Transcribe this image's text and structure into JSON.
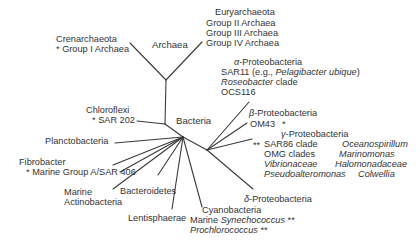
{
  "diagram": {
    "type": "unrooted phylogenetic tree",
    "line_color": "#3a3a3a",
    "text_color": "#333333"
  },
  "domains": {
    "archaea": "Archaea",
    "bacteria": "Bacteria"
  },
  "archaea": {
    "crenarchaeota": {
      "name": "Crenarchaeota",
      "sub": "* Group I Archaea"
    },
    "euryarchaeota": {
      "name": "Euryarchaeota",
      "groups": [
        "Group II Archaea",
        "Group III Archaea",
        "Group IV Archaea"
      ]
    }
  },
  "bacteria": {
    "chloroflexi": {
      "name": "Chloroflexi",
      "sub": "* SAR 202"
    },
    "planctobacteria": "Planctobacteria",
    "fibrobacter": {
      "name": "Fibrobacter",
      "sub": "* Marine Group A/SAR 406"
    },
    "actinobacteria": {
      "line1": "Marine",
      "line2": "Actinobacteria"
    },
    "bacteroidetes": "Bacteroidetes",
    "lentisphaerae": "Lentisphaerae",
    "cyanobacteria": {
      "name": "Cyanobacteria",
      "line2_prefix": "Marine ",
      "line2_italic": "Synechococcus",
      "line2_suffix": " **",
      "line3_italic": "Prochlorococcus",
      "line3_suffix": " **"
    },
    "alpha": {
      "symbol": "α",
      "name": "-Proteobacteria",
      "sar11_prefix": "SAR11 (e.g., ",
      "sar11_italic": "Pelagibacter ubique",
      "sar11_suffix": ")",
      "roseobacter_italic": "Roseobacter",
      "roseobacter_suffix": " clade",
      "ocs": "OCS116"
    },
    "beta": {
      "symbol": "β",
      "name": "-Proteobacteria",
      "om43": "OM43",
      "om43_mark": "*"
    },
    "gamma": {
      "symbol": "γ",
      "name": "-Proteobacteria",
      "mark": "**",
      "left": [
        "SAR86 clade",
        "OMG clades"
      ],
      "left_italic": [
        "Vibrionaceae",
        "Pseudoalteromonas"
      ],
      "right_italic": [
        "Oceanospirillum",
        "Marinomonas",
        "Halomonadaceae",
        "Colwellia"
      ]
    },
    "delta": {
      "symbol": "δ",
      "name": "-Proteobacteria"
    }
  }
}
